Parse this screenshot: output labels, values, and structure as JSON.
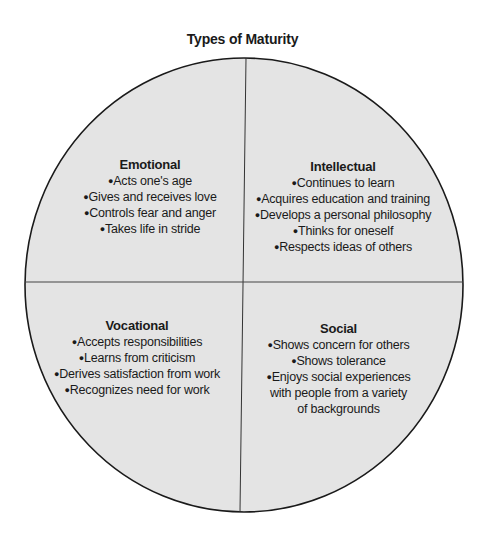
{
  "title": "Types of Maturity",
  "colors": {
    "fill": "#e4e4e4",
    "stroke": "#1a1a1a"
  },
  "quadrants": [
    {
      "heading": "Emotional",
      "items": [
        "Acts one's age",
        "Gives and receives love",
        "Controls fear and anger",
        "Takes life in stride"
      ]
    },
    {
      "heading": "Intellectual",
      "items": [
        "Continues to learn",
        "Acquires education and training",
        "Develops a personal philosophy",
        "Thinks for oneself",
        "Respects ideas of others"
      ]
    },
    {
      "heading": "Vocational",
      "items": [
        "Accepts responsibilities",
        "Learns from criticism",
        "Derives satisfaction from work",
        "Recognizes need for work"
      ]
    },
    {
      "heading": "Social",
      "items": [
        "Shows concern for others",
        "Shows tolerance",
        "Enjoys social experiences",
        "with people from a variety",
        "of backgrounds"
      ]
    }
  ]
}
